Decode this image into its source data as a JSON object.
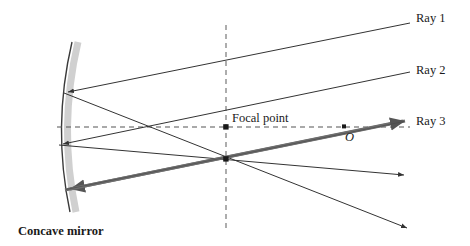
{
  "figure": {
    "background_color": "#ffffff",
    "line_color": "#333333",
    "thick_ray_color": "#6b6b6b",
    "dash_color": "#555555",
    "mirror_shadow_color": "#c9c9c9",
    "width": 470,
    "height": 246
  },
  "labels": {
    "ray1": "Ray 1",
    "ray2": "Ray 2",
    "ray3": "Ray 3",
    "focal_point": "Focal  point",
    "center_point": "O",
    "mirror": "Concave mirror"
  },
  "geometry": {
    "mirror_arc": {
      "top": [
        72,
        42
      ],
      "vertex": [
        56,
        127
      ],
      "bottom": [
        70,
        212
      ],
      "description": "concave arc bulging left"
    },
    "optical_axis": {
      "x1": 57,
      "x2": 410,
      "y": 127,
      "style": "dashed"
    },
    "vertical_dashed": {
      "x": 226,
      "y1": 25,
      "y2": 228,
      "style": "dashed"
    },
    "focal_point_dot": [
      226,
      127
    ],
    "convergence_point": [
      226,
      159
    ],
    "axis_crossing_point": [
      145,
      127
    ],
    "mirror_hit_points": [
      [
        64,
        93
      ],
      [
        59,
        145
      ],
      [
        65,
        190
      ]
    ],
    "incoming_rays": [
      {
        "name": "ray1",
        "from": [
          410,
          23
        ],
        "to": [
          64,
          93
        ]
      },
      {
        "name": "ray2",
        "from": [
          410,
          72
        ],
        "to": [
          59,
          145
        ]
      },
      {
        "name": "ray3",
        "from": [
          405,
          121
        ],
        "to": [
          65,
          190
        ]
      }
    ],
    "reflected_rays": [
      {
        "name": "reflected-from-point-1",
        "from": [
          64,
          93
        ],
        "to": [
          407,
          228
        ]
      },
      {
        "name": "reflected-from-point-2",
        "from": [
          59,
          145
        ],
        "to": [
          404,
          175
        ]
      },
      {
        "name": "reflected-from-point-3",
        "from": [
          65,
          190
        ],
        "to": [
          405,
          121
        ]
      }
    ],
    "arrow_tips": [
      [
        64,
        93
      ],
      [
        59,
        145
      ],
      [
        65,
        190
      ],
      [
        404,
        175
      ],
      [
        407,
        228
      ],
      [
        405,
        121
      ]
    ]
  }
}
